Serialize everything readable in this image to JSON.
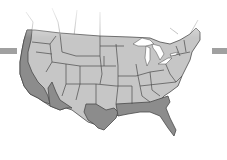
{
  "map": {
    "title": "United States",
    "colors": {
      "background": "#ffffff",
      "interior_state": "#c6c6c6",
      "coastal_state": "#8c8c8c",
      "border": "#4a4a4a",
      "lakes": "#ffffff",
      "side_bar": "#a0a0a0"
    },
    "highlighted_region": "coastal states (Pacific and Gulf/South Atlantic)"
  }
}
